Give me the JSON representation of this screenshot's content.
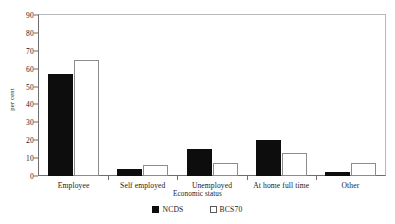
{
  "chart_data": {
    "type": "bar",
    "title": "",
    "xlabel": "Economic status",
    "ylabel": "per cent",
    "ylim": [
      0,
      90
    ],
    "ytick_step": 10,
    "yticks": [
      "0",
      "10",
      "20",
      "30",
      "40",
      "50",
      "60",
      "70",
      "80",
      "90"
    ],
    "grid": false,
    "legend_position": "bottom",
    "categories": [
      "Employee",
      "Self employed",
      "Unemployed",
      "At home full time",
      "Other"
    ],
    "series": [
      {
        "name": "NCDS",
        "style": "filled",
        "color": "#0d0d0d",
        "values": [
          57,
          4,
          15,
          20,
          2
        ]
      },
      {
        "name": "BCS70",
        "style": "hollow",
        "color": "#ffffff",
        "border_color": "#8c8c8c",
        "values": [
          65,
          6,
          7,
          13,
          7
        ]
      }
    ]
  },
  "legend": {
    "items": [
      {
        "label": "NCDS",
        "swatch": "filled-square-icon"
      },
      {
        "label": "BCS70",
        "swatch": "hollow-square-icon"
      }
    ]
  },
  "colors": {
    "ncds": "#0d0d0d",
    "bcs70": "#ffffff",
    "axis": "#6d6d6d",
    "frame": "#b9b9b9",
    "text": "#1a1a1a",
    "background": "#ffffff"
  }
}
